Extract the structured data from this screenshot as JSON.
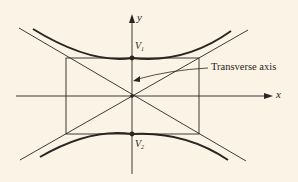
{
  "diagram": {
    "type": "hyperbola",
    "axes": {
      "x_label": "x",
      "y_label": "y"
    },
    "vertices": [
      {
        "name": "V",
        "sub": "1"
      },
      {
        "name": "V",
        "sub": "2"
      }
    ],
    "annotation": "Transverse axis",
    "colors": {
      "background": "#fbf4e6",
      "ink": "#2a2522"
    }
  }
}
